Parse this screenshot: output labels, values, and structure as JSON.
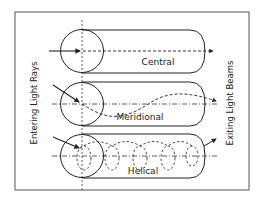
{
  "diagram": {
    "left_label": "Entering Light Rays",
    "right_label": "Exiting Light Beams",
    "modes": [
      {
        "name": "central",
        "label": "Central"
      },
      {
        "name": "meridional",
        "label": "Meridional"
      },
      {
        "name": "helical",
        "label": "Helical"
      }
    ],
    "colors": {
      "stroke": "#222222",
      "background": "#ffffff",
      "frame": "#555555"
    }
  }
}
